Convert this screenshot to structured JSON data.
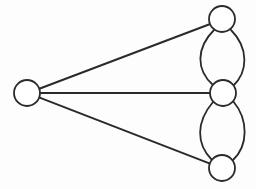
{
  "figure": {
    "background_color": "#fdfdfd",
    "width": 256,
    "height": 189
  },
  "style": {
    "node_fill": "#ffffff",
    "node_stroke": "#2a2a2a",
    "node_stroke_width": 1.8,
    "node_radius": 13,
    "edge_stroke": "#2a2a2a",
    "edge_stroke_width": 2,
    "curved_edge_stroke_width": 1.8
  },
  "graph": {
    "node_count": 4,
    "edge_count": 7,
    "nodes": [
      {
        "id": "left",
        "label": "",
        "cx": 27,
        "cy": 93,
        "r": 13
      },
      {
        "id": "top",
        "label": "",
        "cx": 222,
        "cy": 19,
        "r": 13
      },
      {
        "id": "middle",
        "label": "",
        "cx": 223,
        "cy": 93,
        "r": 13
      },
      {
        "id": "bottom",
        "label": "",
        "cx": 222,
        "cy": 168,
        "r": 13
      }
    ],
    "edges": [
      {
        "id": "e1",
        "from": "left",
        "to": "top",
        "kind": "straight",
        "d": "M 39.3 88.7 L 210.2 24.0"
      },
      {
        "id": "e2",
        "from": "left",
        "to": "middle",
        "kind": "straight",
        "d": "M 40 93 L 210 93"
      },
      {
        "id": "e3",
        "from": "left",
        "to": "bottom",
        "kind": "straight",
        "d": "M 39.0 97.4 L 210.0 163.6"
      },
      {
        "id": "e4",
        "from": "top",
        "to": "middle",
        "kind": "curved",
        "bow": "left",
        "d": "M 214 30 C 196 48, 196 70, 213 85"
      },
      {
        "id": "e5",
        "from": "top",
        "to": "middle",
        "kind": "curved",
        "bow": "right",
        "d": "M 231 30 C 249 48, 248 72, 233 86"
      },
      {
        "id": "e6",
        "from": "middle",
        "to": "bottom",
        "kind": "curved",
        "bow": "left",
        "d": "M 213 102 C 196 122, 196 144, 212 160"
      },
      {
        "id": "e7",
        "from": "middle",
        "to": "bottom",
        "kind": "curved",
        "bow": "right",
        "d": "M 233 101 C 249 120, 248 146, 233 160"
      }
    ]
  }
}
